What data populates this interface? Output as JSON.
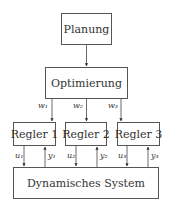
{
  "diagram": {
    "nodes": {
      "planung": "Planung",
      "optimierung": "Optimierung",
      "regler1": "Regler 1",
      "regler2": "Regler 2",
      "regler3": "Regler 3",
      "system": "Dynamisches System"
    },
    "edges": {
      "w1": "w₁",
      "w2": "w₂",
      "w3": "w₃",
      "u1": "u₁",
      "u2": "u₂",
      "u3": "u₃",
      "y1": "y₁",
      "y2": "y₂",
      "y3": "y₃"
    },
    "colors": {
      "line": "#444444",
      "background": "#ffffff"
    }
  }
}
